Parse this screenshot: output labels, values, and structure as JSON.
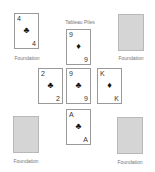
{
  "tableau_label": "Tableau Piles",
  "foundations": [
    {
      "label": "Foundation",
      "card": {
        "rank": "4",
        "suit": "♣",
        "suit_name": "clubs"
      }
    },
    {
      "label": "Foundation",
      "card": null
    },
    {
      "label": "Foundation",
      "card": null
    },
    {
      "label": "Foundation",
      "card": null
    }
  ],
  "tableau": [
    {
      "rank": "9",
      "suit": "♦",
      "suit_name": "diamonds"
    },
    {
      "rank": "2",
      "suit": "♣",
      "suit_name": "clubs"
    },
    {
      "rank": "9",
      "suit": "♣",
      "suit_name": "clubs"
    },
    {
      "rank": "K",
      "suit": "♦",
      "suit_name": "diamonds"
    },
    {
      "rank": "A",
      "suit": "♣",
      "suit_name": "clubs"
    }
  ],
  "colors": {
    "pile_fill": "#d5d5d5",
    "card_border": "#9a9a9a",
    "label_text": "#777777"
  }
}
